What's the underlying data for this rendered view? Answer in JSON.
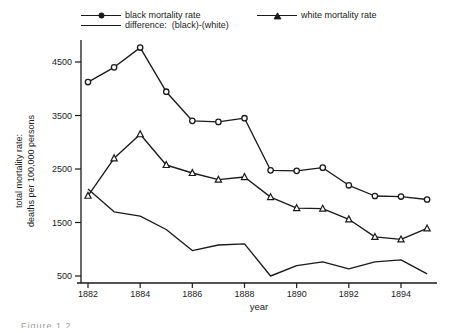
{
  "figure": {
    "caption_partial": "Figure 1.2"
  },
  "chart_data": {
    "type": "line",
    "title": "",
    "xlabel": "year",
    "ylabel_line1": "total mortality rate:",
    "ylabel_line2": "deaths per 100,000 persons",
    "x": [
      1882,
      1883,
      1884,
      1885,
      1886,
      1887,
      1888,
      1889,
      1890,
      1891,
      1892,
      1893,
      1894,
      1895
    ],
    "x_ticks": [
      1882,
      1884,
      1886,
      1888,
      1890,
      1892,
      1894
    ],
    "y_ticks": [
      500,
      1500,
      2500,
      3500,
      4500
    ],
    "xlim": [
      1881.5,
      1895.5
    ],
    "ylim": [
      250,
      4900
    ],
    "grid": false,
    "legend_position": "top",
    "line_color": "#1a1a1a",
    "series": [
      {
        "name": "black mortality rate",
        "marker": "circle",
        "values": [
          4125,
          4400,
          4770,
          3945,
          3400,
          3380,
          3450,
          2475,
          2465,
          2525,
          2195,
          1995,
          1985,
          1930
        ]
      },
      {
        "name": "white mortality rate",
        "marker": "triangle",
        "values": [
          2000,
          2700,
          3150,
          2575,
          2425,
          2300,
          2350,
          1975,
          1770,
          1760,
          1560,
          1230,
          1185,
          1390
        ]
      },
      {
        "name": "difference:  (black)-(white)",
        "marker": "none",
        "values": [
          2125,
          1700,
          1620,
          1370,
          975,
          1080,
          1100,
          500,
          695,
          765,
          635,
          765,
          800,
          540
        ]
      }
    ]
  }
}
